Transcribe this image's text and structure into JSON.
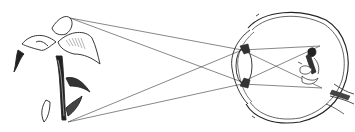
{
  "diagram": {
    "elements": [
      {
        "id": "flower",
        "label": "object (flower)",
        "position": "left"
      },
      {
        "id": "light-rays",
        "label": "light rays",
        "count": 4
      },
      {
        "id": "eye",
        "label": "eyeball cross-section",
        "position": "right"
      },
      {
        "id": "lens",
        "label": "lens"
      },
      {
        "id": "cornea",
        "label": "cornea"
      },
      {
        "id": "retina-image",
        "label": "inverted image on retina"
      },
      {
        "id": "optic-nerve",
        "label": "optic nerve"
      }
    ],
    "colors": {
      "ink": "#222222",
      "background": "#ffffff",
      "ray": "#555555"
    }
  }
}
